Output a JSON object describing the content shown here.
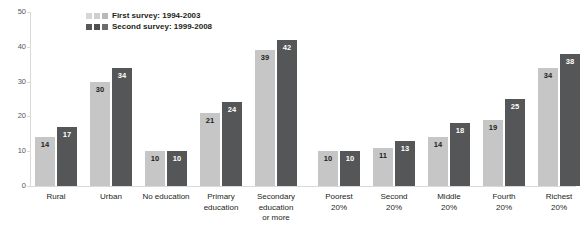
{
  "title": "",
  "legend": {
    "position": "top-left",
    "entries": [
      {
        "label": "First survey: 1994-2003",
        "swatches": [
          "#d6d6d6",
          "#cfcfcf",
          "#b9b9b9"
        ],
        "color": "#c6c6c6"
      },
      {
        "label": "Second survey: 1999-2008",
        "swatches": [
          "#58585a",
          "#4f4f51",
          "#6b6c6e"
        ],
        "color": "#555658"
      }
    ]
  },
  "axis": {
    "y_ticks": [
      "0",
      "10",
      "20",
      "30",
      "40",
      "50"
    ],
    "ylabel": "",
    "xlabel": ""
  },
  "colors": {
    "light_bar": "#c6c6c6",
    "dark_bar": "#555658",
    "axis": "#d9d9d9",
    "text": "#231f20"
  },
  "chart_data": {
    "type": "bar",
    "title": "",
    "xlabel": "",
    "ylabel": "",
    "ylim": [
      0,
      50
    ],
    "yticks": [
      0,
      10,
      20,
      30,
      40,
      50
    ],
    "grid": false,
    "legend_position": "top-left",
    "categories": [
      "Rural",
      "Urban",
      "No education",
      "Primary education",
      "Secondary education or more",
      "Poorest 20%",
      "Second 20%",
      "Middle 20%",
      "Fourth 20%",
      "Richest 20%"
    ],
    "series": [
      {
        "name": "First survey: 1994-2003",
        "values": [
          14,
          30,
          10,
          21,
          39,
          10,
          11,
          14,
          19,
          34
        ]
      },
      {
        "name": "Second survey: 1999-2008",
        "values": [
          17,
          34,
          10,
          24,
          42,
          10,
          13,
          18,
          25,
          38
        ]
      }
    ]
  },
  "groups": [
    {
      "name": "rural",
      "label": "Rural",
      "x": 4,
      "first": 14,
      "second": 17
    },
    {
      "name": "urban",
      "label": "Urban",
      "x": 59,
      "first": 30,
      "second": 34
    },
    {
      "name": "no-education",
      "label": "No education",
      "x": 114,
      "first": 10,
      "second": 10
    },
    {
      "name": "primary-education",
      "label": "Primary\neducation",
      "x": 169,
      "first": 21,
      "second": 24
    },
    {
      "name": "secondary-education-or-more",
      "label": "Secondary\neducation\nor more",
      "x": 224,
      "first": 39,
      "second": 42
    },
    {
      "name": "poorest-20",
      "label": "Poorest\n20%",
      "x": 287,
      "first": 10,
      "second": 10
    },
    {
      "name": "second-20",
      "label": "Second\n20%",
      "x": 342,
      "first": 11,
      "second": 13
    },
    {
      "name": "middle-20",
      "label": "Middle\n20%",
      "x": 397,
      "first": 14,
      "second": 18
    },
    {
      "name": "fourth-20",
      "label": "Fourth\n20%",
      "x": 452,
      "first": 19,
      "second": 25
    },
    {
      "name": "richest-20",
      "label": "Richest\n20%",
      "x": 507,
      "first": 34,
      "second": 38
    }
  ]
}
